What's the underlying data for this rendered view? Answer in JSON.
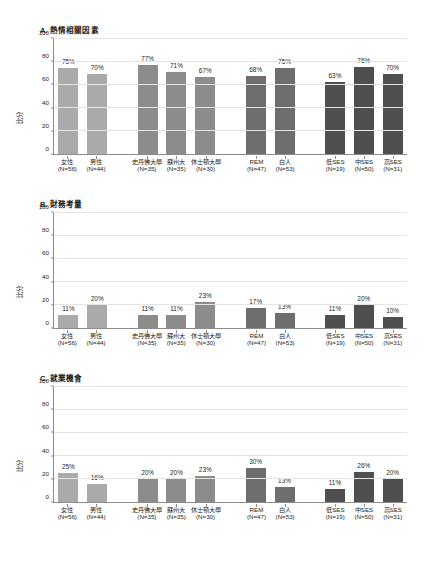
{
  "chart_data": {
    "type": "bar",
    "title": "",
    "panels": [
      {
        "id": "A",
        "title": "A. 熱情相關因素",
        "ylabel": "比分",
        "ylim": [
          0,
          100
        ],
        "yticks": [
          0,
          20,
          40,
          60,
          80,
          100
        ],
        "grid": true,
        "categories": [
          "女性",
          "男性",
          "史丹佛大學",
          "蘇州大",
          "休士頓大學",
          "REM",
          "白人",
          "低SES",
          "中SES",
          "高SES"
        ],
        "sublabels": [
          "(N=56)",
          "(N=44)",
          "(N=35)",
          "(N=35)",
          "(N=30)",
          "(N=47)",
          "(N=53)",
          "(N=19)",
          "(N=50)",
          "(N=31)"
        ],
        "values": [
          75,
          70,
          77,
          71,
          67,
          68,
          75,
          63,
          76,
          70
        ],
        "value_labels": [
          "75%",
          "70%",
          "77%",
          "71%",
          "67%",
          "68%",
          "75%",
          "63%",
          "76%",
          "70%"
        ]
      },
      {
        "id": "B",
        "title": "B. 財務考量",
        "ylabel": "比分",
        "ylim": [
          0,
          100
        ],
        "yticks": [
          0,
          20,
          40,
          60,
          80,
          100
        ],
        "grid": true,
        "categories": [
          "女性",
          "男性",
          "史丹佛大學",
          "蘇州大",
          "休士頓大學",
          "REM",
          "白人",
          "低SES",
          "中SES",
          "高SES"
        ],
        "sublabels": [
          "(N=56)",
          "(N=44)",
          "(N=35)",
          "(N=35)",
          "(N=30)",
          "(N=47)",
          "(N=53)",
          "(N=19)",
          "(N=50)",
          "(N=31)"
        ],
        "values": [
          11,
          20,
          11,
          11,
          23,
          17,
          13,
          11,
          20,
          10
        ],
        "value_labels": [
          "11%",
          "20%",
          "11%",
          "11%",
          "23%",
          "17%",
          "13%",
          "11%",
          "20%",
          "10%"
        ]
      },
      {
        "id": "C",
        "title": "C. 就業機會",
        "ylabel": "比分",
        "ylim": [
          0,
          100
        ],
        "yticks": [
          0,
          20,
          40,
          60,
          80,
          100
        ],
        "grid": true,
        "categories": [
          "女性",
          "男性",
          "史丹佛大學",
          "蘇州大",
          "休士頓大學",
          "REM",
          "白人",
          "低SES",
          "中SES",
          "高SES"
        ],
        "sublabels": [
          "(N=56)",
          "(N=44)",
          "(N=35)",
          "(N=35)",
          "(N=30)",
          "(N=47)",
          "(N=53)",
          "(N=19)",
          "(N=50)",
          "(N=31)"
        ],
        "values": [
          25,
          16,
          20,
          20,
          23,
          30,
          13,
          11,
          26,
          20
        ],
        "value_labels": [
          "25%",
          "16%",
          "20%",
          "20%",
          "23%",
          "30%",
          "13%",
          "11%",
          "26%",
          "20%"
        ]
      }
    ],
    "group_structure": [
      {
        "name": "gender",
        "count": 2,
        "color": "#aaaaaa"
      },
      {
        "name": "university",
        "count": 3,
        "color": "#8c8c8c"
      },
      {
        "name": "race-ethnicity",
        "count": 2,
        "color": "#6e6e6e"
      },
      {
        "name": "socioeconomic-status",
        "count": 3,
        "color": "#4f4f4f"
      }
    ]
  },
  "colors": {
    "axis": "#8b8b8b",
    "grid": "#e4e4e4",
    "text": "#231f20",
    "gender_bar": "#aaaaaa",
    "university_bar": "#8c8c8c",
    "race_bar": "#6e6e6e",
    "ses_bar": "#4f4f4f"
  }
}
